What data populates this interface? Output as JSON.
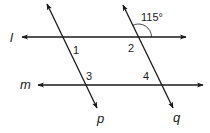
{
  "diagram": {
    "lines": {
      "l": {
        "label": "l",
        "type": "parallel"
      },
      "m": {
        "label": "m",
        "type": "parallel"
      },
      "p": {
        "label": "p",
        "type": "transversal"
      },
      "q": {
        "label": "q",
        "type": "transversal"
      }
    },
    "angles": {
      "a1": "1",
      "a2": "2",
      "a3": "3",
      "a4": "4",
      "given": "115°"
    },
    "colors": {
      "stroke": "#1a1a1a",
      "background": "#ffffff"
    }
  }
}
